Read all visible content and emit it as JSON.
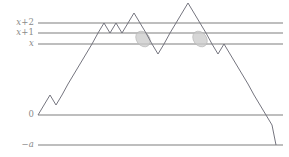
{
  "figure": {
    "background_color": "#ffffff",
    "width": 289,
    "height": 157
  },
  "colors": {
    "level_line": "#a8a8a8",
    "path_stroke": "#6e6e78",
    "label_text": "#8a8a8a",
    "crossing_fill": "#c9c9c9",
    "crossing_stroke": "#b4b4b4"
  },
  "axis_labels": [
    {
      "id": "label-x-plus-2",
      "text": "x+2",
      "base": "x",
      "offset": "+2",
      "level": 9,
      "y": 23
    },
    {
      "id": "label-x-plus-1",
      "text": "x+1",
      "base": "x",
      "offset": "+1",
      "level": 8,
      "y": 33
    },
    {
      "id": "label-x",
      "text": "x",
      "base": "x",
      "offset": "",
      "level": 7,
      "y": 44
    },
    {
      "id": "label-zero",
      "text": "0",
      "base": "0",
      "offset": "",
      "level": 0,
      "y": 115
    },
    {
      "id": "label-minus-a",
      "text": "−a",
      "base": "a",
      "offset": "−",
      "level": -3,
      "y": 145
    }
  ],
  "level_lines": [
    {
      "id": "line-x-plus-2",
      "label": "x+2",
      "y": 23,
      "x1": 38,
      "x2": 283
    },
    {
      "id": "line-x-plus-1",
      "label": "x+1",
      "y": 33,
      "x1": 38,
      "x2": 283
    },
    {
      "id": "line-x",
      "label": "x",
      "y": 44,
      "x1": 38,
      "x2": 283
    },
    {
      "id": "line-zero",
      "label": "0",
      "y": 115,
      "x1": 38,
      "x2": 283
    },
    {
      "id": "line-minus-a",
      "label": "−a",
      "y": 145,
      "x1": 38,
      "x2": 283
    }
  ],
  "chart_data": {
    "type": "line",
    "xlabel": "",
    "ylabel": "",
    "grid": false,
    "legend": "none",
    "axis_levels": {
      "zero": 0,
      "x": 7,
      "x_plus_1": 8,
      "x_plus_2": 9,
      "minus_a": -3
    },
    "ylim": [
      -3,
      10
    ],
    "step_x": 5.95,
    "step_y": 10.15,
    "origin_px": {
      "x": 38,
      "y": 115
    },
    "series": [
      {
        "name": "walk",
        "steps": [
          1,
          1,
          -1,
          1,
          1,
          1,
          1,
          1,
          1,
          1,
          1,
          -1,
          1,
          -1,
          1,
          1,
          -1,
          -1,
          -1,
          -1,
          1,
          1,
          1,
          1,
          1,
          -1,
          -1,
          -1,
          -1,
          1,
          1,
          -1,
          -1,
          -1,
          -1,
          -1,
          -1,
          -1,
          -1,
          -1
        ],
        "values": [
          0,
          1,
          2,
          1,
          2,
          3,
          4,
          5,
          6,
          7,
          8,
          9,
          8,
          9,
          8,
          9,
          10,
          9,
          8,
          7,
          6,
          7,
          8,
          9,
          10,
          11,
          10,
          9,
          8,
          7,
          8,
          9,
          8,
          7,
          6,
          5,
          4,
          3,
          2,
          1,
          0
        ],
        "points_px": [
          [
            38,
            115
          ],
          [
            44,
            105
          ],
          [
            50,
            95
          ],
          [
            56,
            105
          ],
          [
            62,
            95
          ],
          [
            68,
            84
          ],
          [
            74,
            74
          ],
          [
            80,
            64
          ],
          [
            86,
            54
          ],
          [
            92,
            44
          ],
          [
            98,
            33
          ],
          [
            104,
            23
          ],
          [
            110,
            33
          ],
          [
            116,
            23
          ],
          [
            122,
            33
          ],
          [
            128,
            23
          ],
          [
            134,
            13
          ],
          [
            140,
            23
          ],
          [
            146,
            33
          ],
          [
            152,
            44
          ],
          [
            158,
            54
          ],
          [
            164,
            44
          ],
          [
            170,
            33
          ],
          [
            176,
            23
          ],
          [
            182,
            13
          ],
          [
            188,
            3
          ],
          [
            194,
            13
          ],
          [
            200,
            23
          ],
          [
            206,
            33
          ],
          [
            212,
            44
          ],
          [
            218,
            54
          ],
          [
            224,
            44
          ],
          [
            230,
            54
          ],
          [
            236,
            64
          ],
          [
            242,
            74
          ],
          [
            248,
            84
          ],
          [
            254,
            95
          ],
          [
            260,
            105
          ],
          [
            266,
            115
          ],
          [
            272,
            125
          ],
          [
            276,
            145
          ]
        ]
      }
    ],
    "annotations": [
      {
        "id": "crossing-1",
        "type": "ellipse",
        "label": "down-crossing of x+1",
        "cx": 143,
        "cy": 39,
        "rx": 6.5,
        "ry": 8.5,
        "rotation": -37
      },
      {
        "id": "crossing-2",
        "type": "ellipse",
        "label": "down-crossing of x+1",
        "cx": 200,
        "cy": 39,
        "rx": 6.5,
        "ry": 8.5,
        "rotation": -37
      }
    ]
  }
}
